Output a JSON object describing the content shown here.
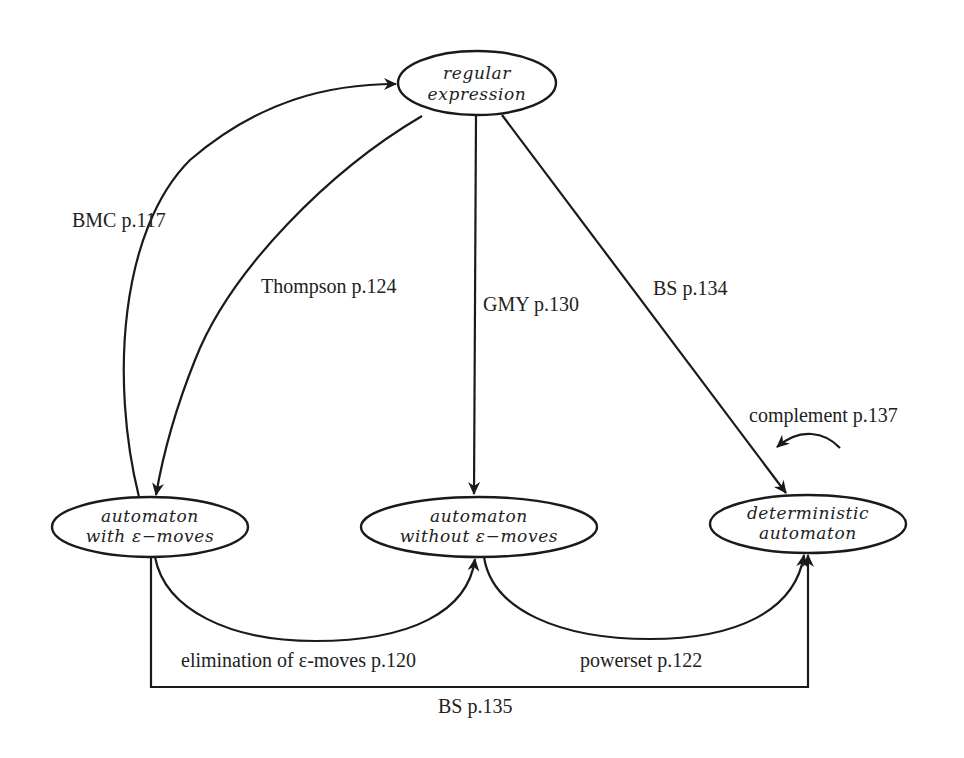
{
  "diagram": {
    "type": "state-conversion-graph",
    "colors": {
      "stroke": "#1a1a1a",
      "text": "#222222",
      "background": "#ffffff"
    },
    "nodes": {
      "regex": {
        "line1": "regular",
        "line2": "expression"
      },
      "eps": {
        "line1": "automaton",
        "line2": "with ε−moves"
      },
      "noeps": {
        "line1": "automaton",
        "line2": "without ε−moves"
      },
      "det": {
        "line1": "deterministic",
        "line2": "automaton"
      }
    },
    "edges": {
      "bmc": {
        "label": "BMC p.117",
        "from": "automaton with ε-moves",
        "to": "regular expression"
      },
      "thompson": {
        "label": "Thompson p.124",
        "from": "regular expression",
        "to": "automaton with ε-moves"
      },
      "gmy": {
        "label": "GMY p.130",
        "from": "regular expression",
        "to": "automaton without ε-moves"
      },
      "bs134": {
        "label": "BS p.134",
        "from": "regular expression",
        "to": "deterministic automaton"
      },
      "complement": {
        "label": "complement p.137",
        "from": "deterministic automaton",
        "to": "deterministic automaton"
      },
      "elimination": {
        "label": "elimination of ε-moves p.120",
        "from": "automaton with ε-moves",
        "to": "automaton without ε-moves"
      },
      "powerset": {
        "label": "powerset p.122",
        "from": "automaton without ε-moves",
        "to": "deterministic automaton"
      },
      "bs135": {
        "label": "BS p.135",
        "from": "automaton with ε-moves",
        "to": "deterministic automaton"
      }
    }
  }
}
